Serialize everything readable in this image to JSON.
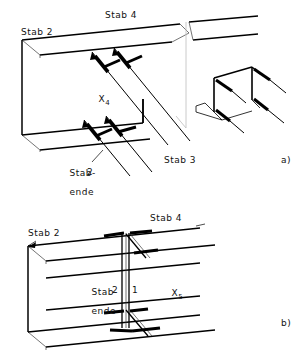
{
  "figure": {
    "title_visible": false,
    "background_color": "#ffffff",
    "line_color": "#000000",
    "thin_line_color": "#555555",
    "break_line_color": "#b9b9b9"
  },
  "panel_a": {
    "caption": "a)",
    "labels": {
      "stab2": "Stab 2",
      "stab4": "Stab 4",
      "stab3": "Stab 3",
      "x4_base": "X",
      "x4_sub": "4",
      "stabende_line1": "Stab-",
      "stabende_line2": "ende",
      "stabende_number": "2"
    }
  },
  "panel_b": {
    "caption": "b)",
    "labels": {
      "stab2": "Stab 2",
      "stab4": "Stab 4",
      "stabende_line1": "Stab-",
      "stabende_line2": "ende",
      "number_2": "2",
      "number_1": "1",
      "x5_base": "X",
      "x5_sub": "5"
    }
  }
}
